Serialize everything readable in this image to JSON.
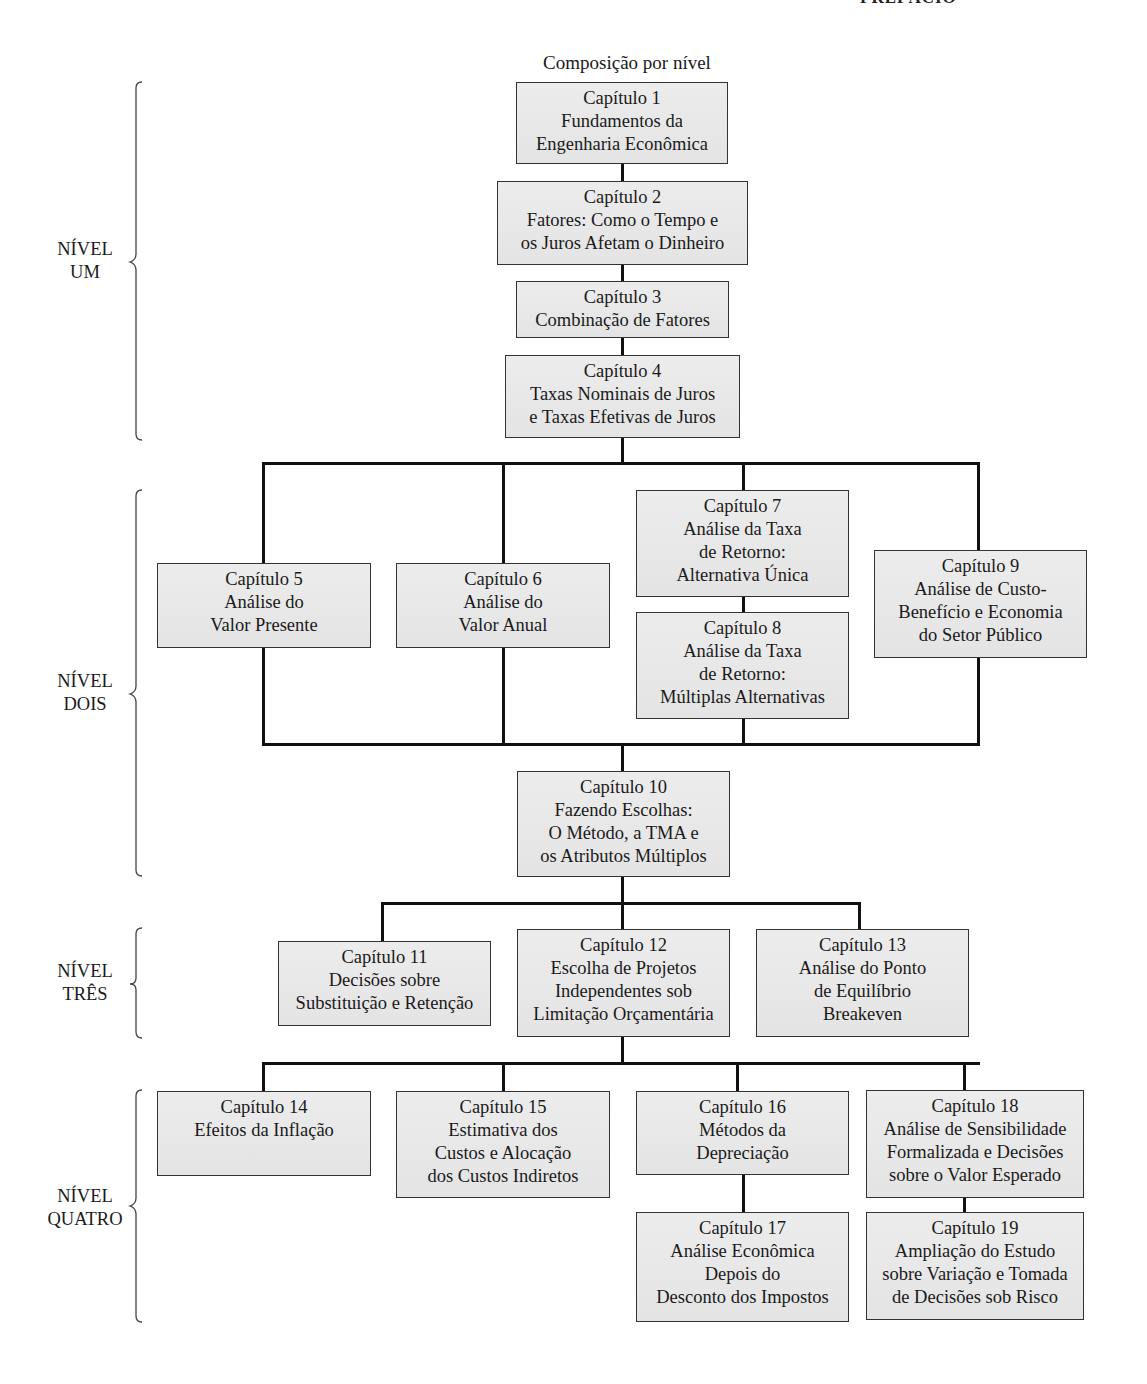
{
  "header": "PREFÁCIO",
  "title": "Composição por nível",
  "levels": [
    {
      "line1": "NÍVEL",
      "line2": "UM"
    },
    {
      "line1": "NÍVEL",
      "line2": "DOIS"
    },
    {
      "line1": "NÍVEL",
      "line2": "TRÊS"
    },
    {
      "line1": "NÍVEL",
      "line2": "QUATRO"
    }
  ],
  "chapters": {
    "c1": [
      "Capítulo 1",
      "Fundamentos da",
      "Engenharia Econômica"
    ],
    "c2": [
      "Capítulo 2",
      "Fatores: Como o Tempo e",
      "os Juros Afetam o Dinheiro"
    ],
    "c3": [
      "Capítulo 3",
      "Combinação de Fatores"
    ],
    "c4": [
      "Capítulo 4",
      "Taxas Nominais de Juros",
      "e Taxas Efetivas de Juros"
    ],
    "c5": [
      "Capítulo 5",
      "Análise do",
      "Valor Presente"
    ],
    "c6": [
      "Capítulo 6",
      "Análise do",
      "Valor Anual"
    ],
    "c7": [
      "Capítulo 7",
      "Análise da Taxa",
      "de Retorno:",
      "Alternativa Única"
    ],
    "c8": [
      "Capítulo 8",
      "Análise da Taxa",
      "de Retorno:",
      "Múltiplas Alternativas"
    ],
    "c9": [
      "Capítulo 9",
      "Análise de Custo-",
      "Benefício e Economia",
      "do Setor Público"
    ],
    "c10": [
      "Capítulo 10",
      "Fazendo Escolhas:",
      "O Método, a TMA e",
      "os Atributos Múltiplos"
    ],
    "c11": [
      "Capítulo 11",
      "Decisões sobre",
      "Substituição e Retenção"
    ],
    "c12": [
      "Capítulo 12",
      "Escolha de Projetos",
      "Independentes sob",
      "Limitação Orçamentária"
    ],
    "c13": [
      "Capítulo 13",
      "Análise do Ponto",
      "de Equilíbrio",
      "Breakeven"
    ],
    "c14": [
      "Capítulo 14",
      "Efeitos da Inflação"
    ],
    "c15": [
      "Capítulo 15",
      "Estimativa dos",
      "Custos e Alocação",
      "dos Custos Indiretos"
    ],
    "c16": [
      "Capítulo 16",
      "Métodos da",
      "Depreciação"
    ],
    "c17": [
      "Capítulo 17",
      "Análise Econômica",
      "Depois do",
      "Desconto dos Impostos"
    ],
    "c18": [
      "Capítulo 18",
      "Análise de Sensibilidade",
      "Formalizada e Decisões",
      "sobre o Valor Esperado"
    ],
    "c19": [
      "Capítulo 19",
      "Ampliação do Estudo",
      "sobre Variação e Tomada",
      "de Decisões sob Risco"
    ]
  }
}
